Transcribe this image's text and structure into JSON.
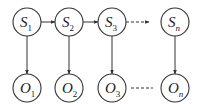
{
  "diagram": {
    "type": "hidden-markov-model",
    "stroke_color": "#333333",
    "background": "#ffffff",
    "states": [
      {
        "id": "S1",
        "letter": "S",
        "sub": "1",
        "cx": 27,
        "cy": 22
      },
      {
        "id": "S2",
        "letter": "S",
        "sub": "2",
        "cx": 69,
        "cy": 22
      },
      {
        "id": "S3",
        "letter": "S",
        "sub": "3",
        "cx": 112,
        "cy": 22
      },
      {
        "id": "Sn",
        "letter": "S",
        "sub": "n",
        "cx": 175,
        "cy": 22
      }
    ],
    "observations": [
      {
        "id": "O1",
        "letter": "O",
        "sub": "1",
        "cx": 27,
        "cy": 88
      },
      {
        "id": "O2",
        "letter": "O",
        "sub": "2",
        "cx": 69,
        "cy": 88
      },
      {
        "id": "O3",
        "letter": "O",
        "sub": "3",
        "cx": 112,
        "cy": 88
      },
      {
        "id": "On",
        "letter": "O",
        "sub": "n",
        "cx": 175,
        "cy": 88
      }
    ],
    "node_radius": 14,
    "edges": [
      {
        "from": "S1",
        "to": "S2",
        "style": "solid",
        "arrow": true
      },
      {
        "from": "S2",
        "to": "S3",
        "style": "solid",
        "arrow": true
      },
      {
        "from": "S3",
        "to": "Sn",
        "style": "dashed",
        "arrow": true
      },
      {
        "from": "S1",
        "to": "O1",
        "style": "solid",
        "arrow": true
      },
      {
        "from": "S2",
        "to": "O2",
        "style": "solid",
        "arrow": true
      },
      {
        "from": "S3",
        "to": "O3",
        "style": "solid",
        "arrow": true
      },
      {
        "from": "Sn",
        "to": "On",
        "style": "solid",
        "arrow": true
      },
      {
        "from": "O3",
        "to": "On",
        "style": "dashed",
        "arrow": false
      }
    ]
  }
}
